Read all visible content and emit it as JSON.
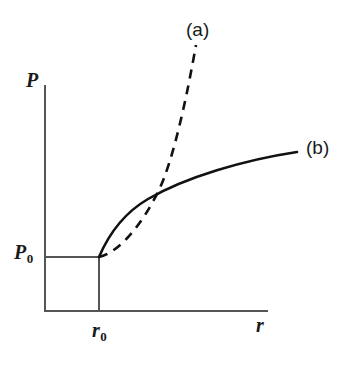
{
  "figure": {
    "background_color": "#ffffff",
    "axis_color": "#555555",
    "curve_color": "#111111",
    "width": 349,
    "height": 365
  },
  "axes": {
    "y_label": "P",
    "x_label": "r",
    "y_reference_label": "P",
    "y_reference_subscript": "0",
    "x_reference_label": "r",
    "x_reference_subscript": "0",
    "y_axis": {
      "x": 44,
      "y_top": 85,
      "y_bottom": 311
    },
    "x_axis": {
      "y": 311,
      "x_left": 44,
      "x_right": 268
    },
    "guides": {
      "p0_horizontal": {
        "y": 257,
        "x_start": 44,
        "x_end": 99
      },
      "r0_vertical": {
        "x": 99,
        "y_start": 257,
        "y_end": 311
      }
    }
  },
  "curves": [
    {
      "id": "curve-a",
      "label": "(a)",
      "style": "dashed",
      "dash_pattern": "9 7",
      "path": "M 99 257 C 120 252, 142 224, 158 192 C 174 160, 188 90, 196 45",
      "label_position": {
        "x": 186,
        "y": 20
      }
    },
    {
      "id": "curve-b",
      "label": "(b)",
      "style": "solid",
      "path": "M 99 257 C 108 236, 124 213, 148 199 C 186 177, 244 160, 297 152",
      "label_position": {
        "x": 306,
        "y": 138
      }
    }
  ],
  "annotations": {
    "intersection_note": "(a) crosses (b) near r slightly greater than r0",
    "origin_of_curves": {
      "x": 99,
      "y": 257
    }
  },
  "chart_data": {
    "type": "line",
    "title": "",
    "xlabel": "r",
    "ylabel": "P",
    "grid": false,
    "legend_position": "inline-curve-end-labels",
    "xlim": [
      0,
      1
    ],
    "ylim": [
      0,
      1
    ],
    "x_tick_labels": [
      "r₀"
    ],
    "y_tick_labels": [
      "P₀"
    ],
    "annotations": [
      {
        "text": "(a)",
        "x": 0.68,
        "y": 0.95
      },
      {
        "text": "(b)",
        "x": 1.16,
        "y": 0.7
      }
    ],
    "series": [
      {
        "name": "(a)",
        "style": "dashed",
        "description": "Rises gently from (r0, P0), then steepens sharply and continues upward off the top of the frame, crossing series (b) shortly after r0.",
        "x": [
          0.245,
          0.33,
          0.42,
          0.5,
          0.57,
          0.62,
          0.66,
          0.7
        ],
        "y": [
          0.239,
          0.272,
          0.34,
          0.438,
          0.56,
          0.69,
          0.83,
          0.96
        ]
      },
      {
        "name": "(b)",
        "style": "solid",
        "description": "Rises steeply just above (r0, P0), then bends over and increases slowly, flattening toward the right edge.",
        "x": [
          0.245,
          0.29,
          0.35,
          0.43,
          0.55,
          0.7,
          0.85,
          1.0,
          1.13
        ],
        "y": [
          0.239,
          0.33,
          0.42,
          0.48,
          0.524,
          0.56,
          0.585,
          0.602,
          0.614
        ]
      }
    ]
  }
}
